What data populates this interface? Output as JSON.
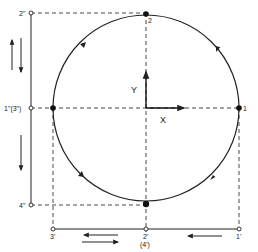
{
  "diagram": {
    "type": "circular-orbit-projection",
    "colors": {
      "ink": "#222222",
      "background": "#ffffff"
    },
    "axes": {
      "x_label": "X",
      "y_label": "Y"
    },
    "points": {
      "p1": "1",
      "p2": "2",
      "p1pp": "1\"(3\")",
      "p2pp": "2\"",
      "p4pp": "4\"",
      "p3p": "3'",
      "p2p": "2'",
      "p2p_alt": "(4')",
      "p1p": "1'"
    },
    "circle": {
      "direction": "counterclockwise",
      "arrow_count": 4
    },
    "vertical_projection": {
      "arrows": [
        "up",
        "down",
        "down"
      ]
    },
    "horizontal_projection": {
      "arrows": [
        "left",
        "right",
        "left"
      ]
    }
  }
}
